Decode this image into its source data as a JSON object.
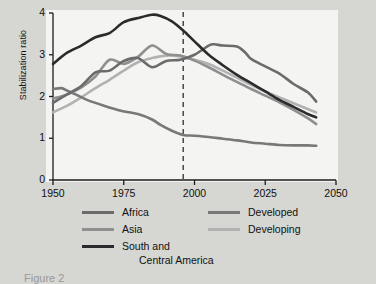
{
  "chart_data": {
    "type": "line",
    "title": "",
    "xlabel": "",
    "ylabel": "Stabilization ratio",
    "xlim": [
      1950,
      2050
    ],
    "ylim": [
      0,
      4
    ],
    "xticks": [
      1950,
      1975,
      2000,
      2025,
      2050
    ],
    "yticks": [
      0,
      1,
      2,
      3,
      4
    ],
    "grid": false,
    "legend_position": "bottom",
    "annotations": [
      {
        "type": "vline",
        "x": 1996,
        "style": "dashed",
        "label": ""
      }
    ],
    "series": [
      {
        "name": "Africa",
        "color": "#6b6b6b",
        "x": [
          1950,
          1955,
          1960,
          1965,
          1970,
          1975,
          1980,
          1985,
          1990,
          1995,
          2000,
          2005,
          2007,
          2010,
          2015,
          2018,
          2020,
          2025,
          2030,
          2035,
          2040,
          2043
        ],
        "values": [
          1.85,
          2.05,
          2.25,
          2.58,
          2.62,
          2.85,
          2.92,
          2.7,
          2.85,
          2.88,
          3.0,
          3.22,
          3.25,
          3.22,
          3.2,
          3.05,
          2.9,
          2.72,
          2.55,
          2.3,
          2.1,
          1.88
        ]
      },
      {
        "name": "Asia",
        "color": "#8f8f8f",
        "x": [
          1950,
          1955,
          1960,
          1965,
          1970,
          1975,
          1980,
          1985,
          1990,
          1995,
          2000,
          2005,
          2010,
          2015,
          2020,
          2025,
          2030,
          2035,
          2040,
          2043
        ],
        "values": [
          1.95,
          2.05,
          2.22,
          2.48,
          2.88,
          2.78,
          2.95,
          3.22,
          3.02,
          2.98,
          2.86,
          2.7,
          2.52,
          2.35,
          2.18,
          2.02,
          1.86,
          1.68,
          1.48,
          1.34
        ]
      },
      {
        "name": "South and Central America",
        "color": "#2b2b2b",
        "x": [
          1950,
          1955,
          1960,
          1965,
          1970,
          1975,
          1980,
          1985,
          1988,
          1992,
          1996,
          2000,
          2005,
          2010,
          2015,
          2020,
          2025,
          2030,
          2035,
          2040,
          2043
        ],
        "values": [
          2.78,
          3.05,
          3.22,
          3.42,
          3.52,
          3.78,
          3.88,
          3.96,
          3.93,
          3.8,
          3.58,
          3.32,
          3.0,
          2.75,
          2.52,
          2.32,
          2.12,
          1.92,
          1.75,
          1.58,
          1.5
        ]
      },
      {
        "name": "Developed",
        "color": "#787878",
        "x": [
          1950,
          1953,
          1955,
          1958,
          1962,
          1968,
          1974,
          1980,
          1985,
          1988,
          1992,
          1996,
          2000,
          2005,
          2010,
          2015,
          2020,
          2025,
          2030,
          2035,
          2040,
          2043
        ],
        "values": [
          2.18,
          2.2,
          2.14,
          2.05,
          1.92,
          1.78,
          1.66,
          1.58,
          1.45,
          1.32,
          1.18,
          1.08,
          1.06,
          1.03,
          0.99,
          0.95,
          0.9,
          0.87,
          0.84,
          0.83,
          0.83,
          0.82
        ]
      },
      {
        "name": "Developing",
        "color": "#b2b2b2",
        "x": [
          1950,
          1955,
          1960,
          1965,
          1970,
          1975,
          1980,
          1985,
          1990,
          1995,
          2000,
          2005,
          2010,
          2015,
          2020,
          2025,
          2030,
          2035,
          2040,
          2043
        ],
        "values": [
          1.62,
          1.78,
          1.98,
          2.2,
          2.4,
          2.62,
          2.82,
          2.92,
          2.98,
          2.96,
          2.88,
          2.78,
          2.62,
          2.45,
          2.28,
          2.12,
          1.98,
          1.84,
          1.7,
          1.62
        ]
      }
    ]
  },
  "axis": {
    "ylabel": "Stabilization ratio",
    "yticks": [
      "0",
      "1",
      "2",
      "3",
      "4"
    ],
    "xticks": [
      "1950",
      "1975",
      "2000",
      "2025",
      "2050"
    ]
  },
  "legend": {
    "left": [
      {
        "label": "Africa",
        "label2": "",
        "color": "#6b6b6b"
      },
      {
        "label": "Asia",
        "label2": "",
        "color": "#8f8f8f"
      },
      {
        "label": "South and",
        "label2": "Central America",
        "color": "#2b2b2b"
      }
    ],
    "right": [
      {
        "label": "Developed",
        "label2": "",
        "color": "#787878"
      },
      {
        "label": "Developing",
        "label2": "",
        "color": "#b2b2b2"
      }
    ]
  },
  "caption": {
    "text": "Figure 2"
  },
  "colors": {
    "page_background": "#d6d6d2",
    "plot_background": "#f4f4f2",
    "axis": "#1d1d1d",
    "annotation_line": "#1d1d1d"
  }
}
